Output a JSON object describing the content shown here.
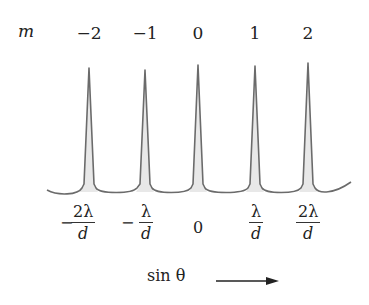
{
  "diagram": {
    "order_label": "m",
    "orders": [
      "−2",
      "−1",
      "0",
      "1",
      "2"
    ],
    "peak_x": [
      89,
      145,
      198,
      255,
      308
    ],
    "peak_top_y": [
      68,
      70,
      65,
      66,
      63
    ],
    "baseline_y": 192,
    "curve_color": "#6b6b6b",
    "fill_color": "#e6e6e6",
    "positions": [
      {
        "sign": "−",
        "numerator": "2λ",
        "denominator": "d"
      },
      {
        "sign": "−",
        "numerator": "λ",
        "denominator": "d"
      },
      {
        "sign": "",
        "value": "0"
      },
      {
        "sign": "",
        "numerator": "λ",
        "denominator": "d"
      },
      {
        "sign": "",
        "numerator": "2λ",
        "denominator": "d"
      }
    ],
    "axis": {
      "label": "sin θ",
      "arrow": "right-arrow"
    }
  }
}
